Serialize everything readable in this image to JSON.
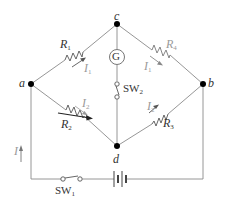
{
  "diagram": {
    "type": "Wheatstone bridge circuit",
    "nodes": {
      "a": {
        "label": "a",
        "x": 31,
        "y": 84
      },
      "b": {
        "label": "b",
        "x": 203,
        "y": 84
      },
      "c": {
        "label": "c",
        "x": 117,
        "y": 24
      },
      "d": {
        "label": "d",
        "x": 117,
        "y": 146
      }
    },
    "components": {
      "R1": {
        "label": "R",
        "sub": "1",
        "branch": "a-c"
      },
      "R2": {
        "label": "R",
        "sub": "2",
        "branch": "a-d",
        "variable": true
      },
      "R3": {
        "label": "R",
        "sub": "3",
        "branch": "d-b"
      },
      "R4": {
        "label": "R",
        "sub": "4",
        "branch": "c-b"
      },
      "galvanometer": {
        "label": "G",
        "branch": "c-d"
      },
      "SW2": {
        "label": "SW",
        "sub": "2",
        "branch": "c-d"
      },
      "SW1": {
        "label": "SW",
        "sub": "1",
        "branch": "battery loop"
      },
      "battery": {
        "label": "",
        "branch": "battery loop"
      }
    },
    "currents": {
      "I": {
        "label": "I",
        "sub": ""
      },
      "I1_left": {
        "label": "I",
        "sub": "1"
      },
      "I1_right": {
        "label": "I",
        "sub": "1"
      },
      "I2_left": {
        "label": "I",
        "sub": "2"
      },
      "I2_right": {
        "label": "I",
        "sub": "2"
      }
    },
    "colors": {
      "wire": "#555555",
      "wire_light": "#8a8a8a",
      "node": "#000000",
      "label_dark": "#333333",
      "label_grey": "#9a9a9a"
    }
  }
}
